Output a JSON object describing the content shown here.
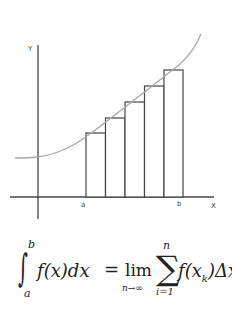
{
  "diagram": {
    "axes": {
      "y_label": "Y",
      "x_label": "X"
    },
    "interval_labels": {
      "a": "a",
      "b": "b"
    },
    "rectangles": 5,
    "colors": {
      "axes": "#444444",
      "bars": "#444444",
      "curve": "#a8a8a8",
      "background": "#ffffff"
    }
  },
  "formula": {
    "integral_sign": "∫",
    "upper_limit": "b",
    "lower_limit": "a",
    "integrand": "f(x)dx",
    "equals": "=",
    "lim": "lim",
    "lim_sub": "n→∞",
    "sigma": "∑",
    "sum_upper": "n",
    "sum_lower": "i=1",
    "summand_f": "f(x",
    "summand_k1": "k",
    "summand_mid": ")Δx",
    "summand_k2": "k"
  }
}
